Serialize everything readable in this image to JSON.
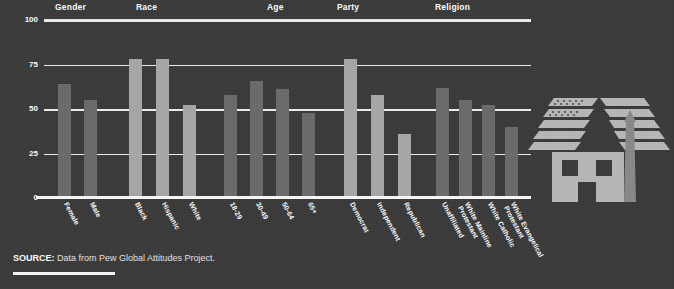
{
  "chart_data": {
    "type": "bar",
    "title": "",
    "xlabel": "",
    "ylabel": "",
    "ylim": [
      0,
      100
    ],
    "yticks": [
      0,
      25,
      50,
      75,
      100
    ],
    "ytick_labels": [
      "0",
      "25",
      "50",
      "75",
      "100"
    ],
    "grid": true,
    "legend": "none",
    "groups": [
      {
        "name": "Gender",
        "shade": "dark",
        "categories": [
          "Female",
          "Male"
        ],
        "values": [
          64,
          55
        ]
      },
      {
        "name": "Race",
        "shade": "light",
        "categories": [
          "Black",
          "Hispanic",
          "White"
        ],
        "values": [
          78,
          78,
          52
        ]
      },
      {
        "name": "Age",
        "shade": "dark",
        "categories": [
          "18-29",
          "30-49",
          "50-64",
          "65+"
        ],
        "values": [
          58,
          66,
          61,
          48
        ]
      },
      {
        "name": "Party",
        "shade": "light",
        "categories": [
          "Democrat",
          "Independent",
          "Republican"
        ],
        "values": [
          78,
          58,
          36
        ]
      },
      {
        "name": "Religion",
        "shade": "dark",
        "categories": [
          "Unaffiliated",
          "White Mainline\nProtestant",
          "White Catholic",
          "White Evangelical\nProtestant"
        ],
        "values": [
          62,
          55,
          52,
          40
        ]
      }
    ]
  },
  "headers": [
    {
      "label": "Gender",
      "x": 55
    },
    {
      "label": "Race",
      "x": 136
    },
    {
      "label": "Age",
      "x": 267
    },
    {
      "label": "Party",
      "x": 337
    },
    {
      "label": "Religion",
      "x": 435
    }
  ],
  "axis": {
    "ticks": [
      {
        "label": "100",
        "value": 100
      },
      {
        "label": "75",
        "value": 75
      },
      {
        "label": "50",
        "value": 50
      },
      {
        "label": "25",
        "value": 25
      },
      {
        "label": "0",
        "value": 0
      }
    ]
  },
  "bars": [
    {
      "label": "Female",
      "value": 64,
      "shade": "dark",
      "x": 14,
      "w": 13
    },
    {
      "label": "Male",
      "value": 55,
      "shade": "dark",
      "x": 40,
      "w": 13
    },
    {
      "label": "Black",
      "value": 78,
      "shade": "light",
      "x": 85,
      "w": 13
    },
    {
      "label": "Hispanic",
      "value": 78,
      "shade": "light",
      "x": 112,
      "w": 13
    },
    {
      "label": "White",
      "value": 52,
      "shade": "light",
      "x": 139,
      "w": 13
    },
    {
      "label": "18-29",
      "value": 58,
      "shade": "dark",
      "x": 180,
      "w": 13
    },
    {
      "label": "30-49",
      "value": 66,
      "shade": "dark",
      "x": 206,
      "w": 13
    },
    {
      "label": "50-64",
      "value": 61,
      "shade": "dark",
      "x": 232,
      "w": 13
    },
    {
      "label": "65+",
      "value": 48,
      "shade": "dark",
      "x": 258,
      "w": 13
    },
    {
      "label": "Democrat",
      "value": 78,
      "shade": "light",
      "x": 300,
      "w": 13
    },
    {
      "label": "Independent",
      "value": 58,
      "shade": "light",
      "x": 327,
      "w": 13
    },
    {
      "label": "Republican",
      "value": 36,
      "shade": "light",
      "x": 354,
      "w": 13
    },
    {
      "label": "Unaffiliated",
      "value": 62,
      "shade": "dark",
      "x": 392,
      "w": 13
    },
    {
      "label": "White Mainline\nProtestant",
      "value": 55,
      "shade": "dark",
      "x": 415,
      "w": 13
    },
    {
      "label": "White Catholic",
      "value": 52,
      "shade": "dark",
      "x": 438,
      "w": 13
    },
    {
      "label": "White Evangelical\nProtestant",
      "value": 40,
      "shade": "dark",
      "x": 461,
      "w": 13
    }
  ],
  "source": {
    "label": "SOURCE:",
    "text": " Data from Pew Global Attitudes Project."
  },
  "graphic": {
    "name": "house-with-american-flag-roof",
    "flag_stripe_color": "#b9b9b9",
    "house_color": "#b9b9b9",
    "chimney_color": "#8a8a8a"
  },
  "colors": {
    "background": "#3a3a3a",
    "bar_dark": "#6b6b6b",
    "bar_light": "#a8a8a8",
    "gridline": "#f0f0f0",
    "text": "#ffffff"
  }
}
